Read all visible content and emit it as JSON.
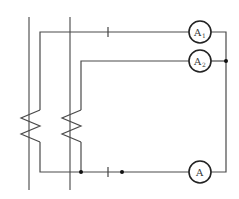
{
  "diagram": {
    "type": "circuit",
    "colors": {
      "wire": "#4a4a4a",
      "meter_outline": "#222222",
      "junction": "#111111"
    },
    "meters": [
      {
        "id": "A1",
        "label": "A",
        "subscript": "1"
      },
      {
        "id": "A2",
        "label": "A",
        "subscript": "2"
      },
      {
        "id": "A",
        "label": "A",
        "subscript": ""
      }
    ],
    "components": [
      {
        "name": "busbar-left"
      },
      {
        "name": "busbar-right"
      },
      {
        "name": "coil-left"
      },
      {
        "name": "coil-right"
      },
      {
        "name": "break-mark-top"
      },
      {
        "name": "break-mark-bottom"
      }
    ],
    "junctions": 3
  }
}
